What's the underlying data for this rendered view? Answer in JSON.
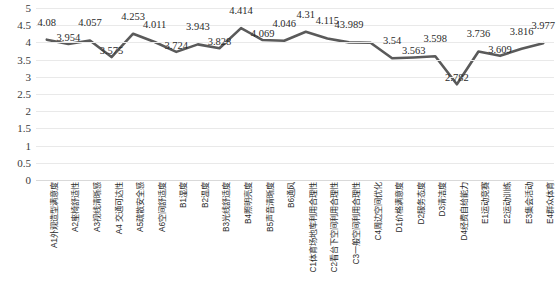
{
  "chart_data": {
    "type": "line",
    "title": "",
    "subtitle": "",
    "xlabel": "",
    "ylabel": "",
    "ylim": [
      0,
      5
    ],
    "grid": true,
    "legend": "none",
    "series_name": "",
    "line_color": "#5a5a5a",
    "gridline_color": "#e9e9e9",
    "y_ticks": [
      "5",
      "4.5",
      "4",
      "3.5",
      "3",
      "2.5",
      "2",
      "1.5",
      "1",
      "0.5",
      "0"
    ],
    "y_tick_values": [
      5,
      4.5,
      4,
      3.5,
      3,
      2.5,
      2,
      1.5,
      1,
      0.5,
      0
    ],
    "categories": [
      "A1外观造型满意度",
      "A2座椅舒适性",
      "A3视线清晰感",
      "A4 交通可达性",
      "A5疏散安全感",
      "A6空间舒适度",
      "B1湿度",
      "B2温度",
      "B3光线舒适度",
      "B4照明亮度",
      "B5声音清晰度",
      "B6通风",
      "C1体育场地库利用合理性",
      "C2看台下空间利用合理性",
      "C3一般空间利用合理性",
      "C4周边空间优化",
      "D1价格满意度",
      "D2服务态度",
      "D3清洁度",
      "D4经费自给能力",
      "E1运动竞赛",
      "E2运动训练",
      "E3集会活动",
      "E4群众体育"
    ],
    "values": [
      4.08,
      3.954,
      4.057,
      3.575,
      4.253,
      4.011,
      3.724,
      3.943,
      3.828,
      4.414,
      4.069,
      4.046,
      4.31,
      4.115,
      4,
      3.989,
      3.54,
      3.563,
      3.598,
      2.782,
      3.736,
      3.609,
      3.816,
      3.977
    ],
    "point_labels": [
      "4.08",
      "3.954",
      "4.057",
      "3.575",
      "4.253",
      "4.011",
      "3.724",
      "3.943",
      "3.828",
      "4.414",
      "4.069",
      "4.046",
      "4.31",
      "4.115",
      "43.989",
      "",
      "3.54",
      "3.563",
      "3.598",
      "2.782",
      "3.736",
      "3.609",
      "3.816",
      "3.977"
    ],
    "label_above": [
      true,
      false,
      true,
      false,
      true,
      true,
      false,
      true,
      false,
      true,
      false,
      true,
      true,
      true,
      true,
      false,
      true,
      false,
      true,
      false,
      true,
      false,
      true,
      true
    ]
  }
}
